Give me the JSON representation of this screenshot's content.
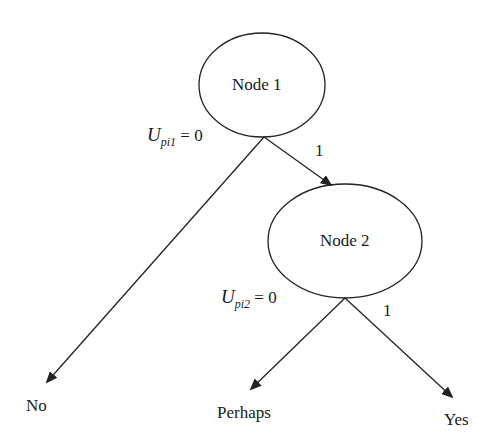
{
  "diagram": {
    "type": "decision-tree",
    "nodes": [
      {
        "id": "node1",
        "label": "Node 1"
      },
      {
        "id": "node2",
        "label": "Node 2"
      }
    ],
    "edges": [
      {
        "from": "node1",
        "to": "no",
        "label_var": "U",
        "label_sub": "pi1",
        "label_rest": " = 0"
      },
      {
        "from": "node1",
        "to": "node2",
        "label": "1"
      },
      {
        "from": "node2",
        "to": "perhaps",
        "label_var": "U",
        "label_sub": "pi2",
        "label_rest": " = 0"
      },
      {
        "from": "node2",
        "to": "yes",
        "label": "1"
      }
    ],
    "leaves": [
      {
        "id": "no",
        "label": "No"
      },
      {
        "id": "perhaps",
        "label": "Perhaps"
      },
      {
        "id": "yes",
        "label": "Yes"
      }
    ],
    "colors": {
      "stroke": "#222222",
      "background": "#ffffff"
    }
  }
}
